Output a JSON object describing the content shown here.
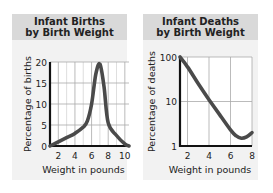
{
  "chart_data": [
    {
      "type": "line",
      "title": "Infant Births by Birth Weight",
      "title_lines": [
        "Infant Births",
        "by Birth Weight"
      ],
      "xlabel": "Weight in pounds",
      "ylabel": "Percentage of births",
      "xlim": [
        1,
        10.5
      ],
      "ylim": [
        0,
        20
      ],
      "x_ticks": [
        "2",
        "4",
        "6",
        "8",
        "10"
      ],
      "y_ticks": [
        "0",
        "5",
        "10",
        "15",
        "20"
      ],
      "grid": true,
      "series": [
        {
          "name": "Percentage of births",
          "x": [
            1,
            2,
            3,
            4,
            5,
            5.5,
            6,
            6.5,
            7,
            7.5,
            8,
            9,
            10,
            10.5
          ],
          "y": [
            0,
            1,
            2,
            3,
            4.5,
            6,
            10,
            17,
            19.5,
            14,
            5.5,
            2.5,
            0.5,
            0
          ]
        }
      ]
    },
    {
      "type": "line",
      "title": "Infant Deaths by Birth Weight",
      "title_lines": [
        "Infant Deaths",
        "by Birth Weight"
      ],
      "xlabel": "Weight in pounds",
      "ylabel": "Percentage of deaths",
      "xlim": [
        1.3,
        8
      ],
      "ylim": [
        1,
        100
      ],
      "yscale": "log",
      "x_ticks": [
        "2",
        "4",
        "6",
        "8"
      ],
      "y_ticks": [
        "1",
        "10",
        "100"
      ],
      "grid": true,
      "series": [
        {
          "name": "Percentage of deaths",
          "x": [
            1.3,
            2,
            3,
            4,
            5,
            6,
            6.5,
            7,
            7.5,
            8
          ],
          "y": [
            100,
            60,
            25,
            11,
            5,
            2.3,
            1.7,
            1.5,
            1.6,
            2
          ]
        }
      ]
    }
  ]
}
